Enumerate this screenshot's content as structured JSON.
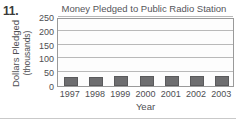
{
  "problem_number": "11.",
  "chart_data": {
    "type": "bar",
    "title": "Money Pledged to Public Radio Station",
    "xlabel": "Year",
    "ylabel_line1": "Dollars Pledged",
    "ylabel_line2": "(thousands)",
    "categories": [
      "1997",
      "1998",
      "1999",
      "2000",
      "2001",
      "2002",
      "2003"
    ],
    "values": [
      32,
      33,
      35,
      35,
      36,
      37,
      37
    ],
    "ylim": [
      0,
      250
    ],
    "yticks": [
      0,
      50,
      100,
      150,
      200,
      250
    ],
    "ytick_labels": [
      "0",
      "50",
      "100",
      "150",
      "200",
      "250"
    ],
    "grid": true,
    "legend": "none",
    "bar_color": "#6e6e70",
    "plot_border_color": "#9a9a9a",
    "gridline_color": "#b9b9b9",
    "background": "#ffffff"
  }
}
